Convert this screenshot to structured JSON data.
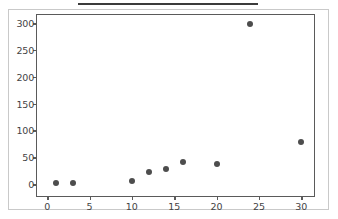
{
  "figure": {
    "background_color": "#ffffff",
    "border_color": "#c9c9c9",
    "axis_color": "#5a5a5a",
    "marker_color": "#4d4d4d",
    "tick_label_color": "#444444",
    "top_rule_color": "#3b3b3b"
  },
  "chart_data": {
    "type": "scatter",
    "title": "",
    "subtitle": "",
    "xlabel": "",
    "ylabel": "",
    "xlim": [
      -1.2,
      31.5
    ],
    "ylim": [
      -22,
      315
    ],
    "xticks": [
      0,
      5,
      10,
      15,
      20,
      25,
      30
    ],
    "xtick_labels": [
      "0",
      "5",
      "10",
      "15",
      "20",
      "25",
      "30"
    ],
    "yticks": [
      0,
      50,
      100,
      150,
      200,
      250,
      300
    ],
    "ytick_labels": [
      "0",
      "50",
      "100",
      "150",
      "200",
      "250",
      "300"
    ],
    "grid": false,
    "legend": null,
    "legend_position": "none",
    "annotations": [],
    "marker_style": "filled-circle",
    "marker_size_px": 6,
    "points": [
      {
        "x": 1,
        "y": 2
      },
      {
        "x": 3,
        "y": 3
      },
      {
        "x": 10,
        "y": 5
      },
      {
        "x": 12,
        "y": 23
      },
      {
        "x": 14,
        "y": 29
      },
      {
        "x": 16,
        "y": 41
      },
      {
        "x": 20,
        "y": 37
      },
      {
        "x": 24,
        "y": 299
      },
      {
        "x": 30,
        "y": 78
      }
    ],
    "series": [
      {
        "name": "",
        "x": [
          1,
          3,
          10,
          12,
          14,
          16,
          20,
          24,
          30
        ],
        "values": [
          2,
          3,
          5,
          23,
          29,
          41,
          37,
          299,
          78
        ]
      }
    ]
  }
}
